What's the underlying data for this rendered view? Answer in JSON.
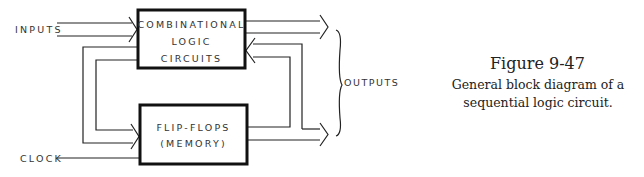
{
  "diagram": {
    "blocks": {
      "combinational": [
        "COMBINATIONAL",
        "LOGIC",
        "CIRCUITS"
      ],
      "flipflops": [
        "FLIP-FLOPS",
        "(MEMORY)"
      ]
    },
    "labels": {
      "inputs": "INPUTS",
      "clock": "CLOCK",
      "outputs": "OUTPUTS"
    }
  },
  "caption": {
    "title": "Figure 9-47",
    "text": "General block diagram of a sequential logic circuit."
  }
}
